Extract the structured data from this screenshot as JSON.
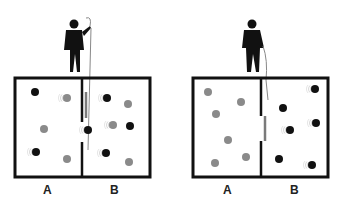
{
  "diagram": {
    "panels": [
      {
        "label_a": "A",
        "label_b": "B",
        "state": "mixed"
      },
      {
        "label_a": "A",
        "label_b": "B",
        "state": "sorted"
      }
    ],
    "colors": {
      "fast": "#111111",
      "slow": "#8a8a8a",
      "door": "#7a7a7a",
      "wall": "#111111"
    }
  }
}
